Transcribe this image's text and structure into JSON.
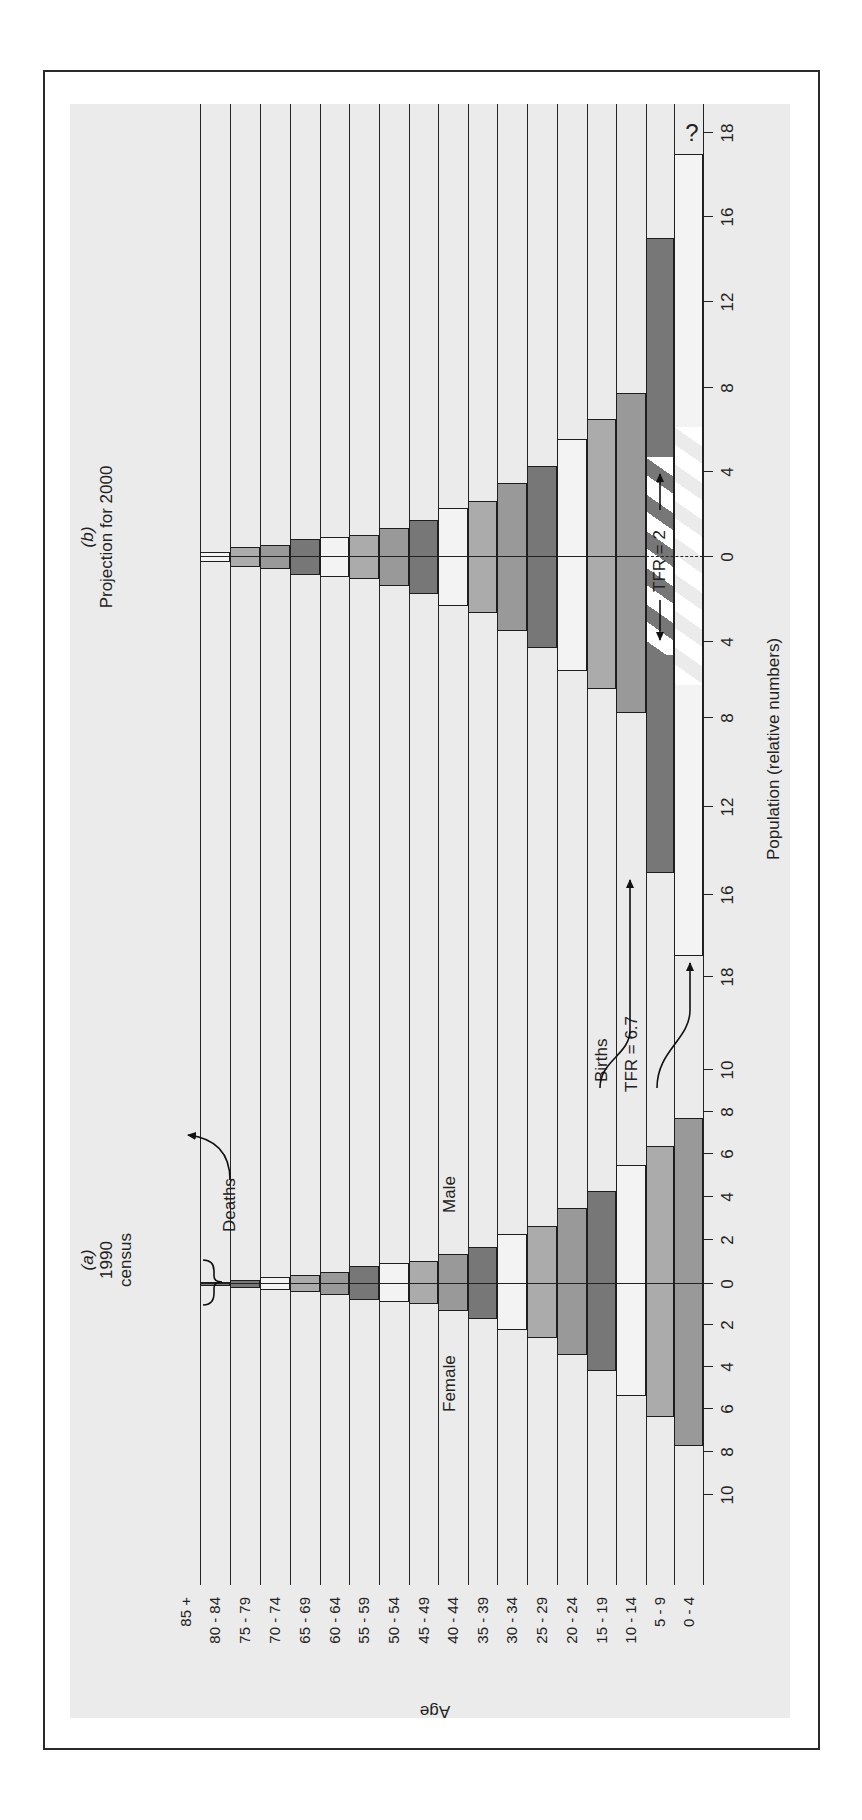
{
  "chart_data": {
    "type": "bar",
    "subtype": "population-pyramid",
    "orientation": "figure rotated 90 degrees counter-clockwise",
    "ylabel": "Age",
    "xlabel": "Population (relative numbers)",
    "age_groups": [
      "85 +",
      "80 - 84",
      "75 - 79",
      "70 - 74",
      "65 - 69",
      "60 - 64",
      "55 - 59",
      "50 - 54",
      "45 - 49",
      "40 - 44",
      "35 - 39",
      "30 - 34",
      "25 - 29",
      "20 - 24",
      "15 - 19",
      "10 - 14",
      "5 - 9",
      "0 - 4"
    ],
    "panels": [
      {
        "id": "a",
        "label": "(a)",
        "title_line1": "1990",
        "title_line2": "census",
        "female_label": "Female",
        "male_label": "Male",
        "center_px": 536,
        "ticks_female": [
          {
            "v": 0,
            "px": 536
          },
          {
            "v": 2,
            "px": 495
          },
          {
            "v": 4,
            "px": 453
          },
          {
            "v": 6,
            "px": 411
          },
          {
            "v": 8,
            "px": 368
          },
          {
            "v": 10,
            "px": 325
          }
        ],
        "ticks_male": [
          {
            "v": 0,
            "px": 536
          },
          {
            "v": 2,
            "px": 580
          },
          {
            "v": 4,
            "px": 623
          },
          {
            "v": 6,
            "px": 666
          },
          {
            "v": 8,
            "px": 708
          },
          {
            "v": 10,
            "px": 750
          }
        ],
        "series": [
          {
            "age": "80 - 84",
            "male": 0.1,
            "female": 0.1,
            "shade": "dark"
          },
          {
            "age": "75 - 79",
            "male": 0.2,
            "female": 0.2,
            "shade": "dark"
          },
          {
            "age": "70 - 74",
            "male": 0.3,
            "female": 0.3,
            "shade": "white"
          },
          {
            "age": "65 - 69",
            "male": 0.4,
            "female": 0.4,
            "shade": "light"
          },
          {
            "age": "60 - 64",
            "male": 0.55,
            "female": 0.55,
            "shade": "mid"
          },
          {
            "age": "55 - 59",
            "male": 0.8,
            "female": 0.8,
            "shade": "dark"
          },
          {
            "age": "50 - 54",
            "male": 0.95,
            "female": 0.9,
            "shade": "white"
          },
          {
            "age": "45 - 49",
            "male": 1.05,
            "female": 1.0,
            "shade": "light"
          },
          {
            "age": "40 - 44",
            "male": 1.35,
            "female": 1.3,
            "shade": "mid"
          },
          {
            "age": "35 - 39",
            "male": 1.7,
            "female": 1.7,
            "shade": "dark"
          },
          {
            "age": "30 - 34",
            "male": 2.3,
            "female": 2.25,
            "shade": "white"
          },
          {
            "age": "25 - 29",
            "male": 2.65,
            "female": 2.6,
            "shade": "light"
          },
          {
            "age": "20 - 24",
            "male": 3.5,
            "female": 3.45,
            "shade": "mid"
          },
          {
            "age": "15 - 19",
            "male": 4.3,
            "female": 4.2,
            "shade": "dark"
          },
          {
            "age": "10 - 14",
            "male": 5.5,
            "female": 5.4,
            "shade": "white"
          },
          {
            "age": "5 - 9",
            "male": 6.4,
            "female": 6.35,
            "shade": "light"
          },
          {
            "age": "0 - 4",
            "male": 7.7,
            "female": 7.7,
            "shade": "mid"
          }
        ]
      },
      {
        "id": "b",
        "label": "(b)",
        "title_line1": "Projection for 2000",
        "center_px": 1263,
        "ticks_female": [
          {
            "v": 0,
            "px": 1263
          },
          {
            "v": 4,
            "px": 1178
          },
          {
            "v": 8,
            "px": 1102
          },
          {
            "v": 12,
            "px": 1013
          },
          {
            "v": 16,
            "px": 925
          },
          {
            "v": 18,
            "px": 843
          }
        ],
        "ticks_male": [
          {
            "v": 0,
            "px": 1263
          },
          {
            "v": 4,
            "px": 1348
          },
          {
            "v": 8,
            "px": 1432
          },
          {
            "v": 12,
            "px": 1518
          },
          {
            "v": 16,
            "px": 1603
          },
          {
            "v": 18,
            "px": 1687
          }
        ],
        "series": [
          {
            "age": "80 - 84",
            "male": 0.25,
            "female": 0.25,
            "shade": "white"
          },
          {
            "age": "75 - 79",
            "male": 0.45,
            "female": 0.45,
            "shade": "light"
          },
          {
            "age": "70 - 74",
            "male": 0.55,
            "female": 0.55,
            "shade": "mid"
          },
          {
            "age": "65 - 69",
            "male": 0.85,
            "female": 0.85,
            "shade": "dark"
          },
          {
            "age": "60 - 64",
            "male": 0.95,
            "female": 0.95,
            "shade": "white"
          },
          {
            "age": "55 - 59",
            "male": 1.05,
            "female": 1.05,
            "shade": "light"
          },
          {
            "age": "50 - 54",
            "male": 1.35,
            "female": 1.35,
            "shade": "mid"
          },
          {
            "age": "45 - 49",
            "male": 1.75,
            "female": 1.75,
            "shade": "dark"
          },
          {
            "age": "40 - 44",
            "male": 2.3,
            "female": 2.3,
            "shade": "white"
          },
          {
            "age": "35 - 39",
            "male": 2.65,
            "female": 2.65,
            "shade": "light"
          },
          {
            "age": "30 - 34",
            "male": 3.5,
            "female": 3.5,
            "shade": "mid"
          },
          {
            "age": "25 - 29",
            "male": 4.3,
            "female": 4.3,
            "shade": "dark"
          },
          {
            "age": "20 - 24",
            "male": 5.55,
            "female": 5.55,
            "shade": "white"
          },
          {
            "age": "15 - 19",
            "male": 6.5,
            "female": 6.5,
            "shade": "light"
          },
          {
            "age": "10 - 14",
            "male": 7.75,
            "female": 7.75,
            "shade": "mid"
          },
          {
            "age": "5 - 9",
            "male": 15,
            "female": 15,
            "shade": "dark"
          },
          {
            "age": "0 - 4",
            "male": 17.5,
            "female": 17.5,
            "shade": "white"
          }
        ],
        "hatched_region": {
          "age": "5 - 9",
          "from": -4.8,
          "to": 4.8
        }
      }
    ],
    "x_tick_labels": [
      "10",
      "8",
      "6",
      "4",
      "2",
      "0",
      "2",
      "4",
      "6",
      "8",
      "10",
      "18",
      "16",
      "12",
      "8",
      "4",
      "0",
      "4",
      "8",
      "12",
      "16",
      "18"
    ],
    "annotations": {
      "deaths": "Deaths",
      "births": "Births",
      "tfr_1990": "TFR = 6.7",
      "tfr_2000": "TFR = 2",
      "unknown_marker": "?"
    },
    "colors": {
      "dark": "#777777",
      "mid": "#999999",
      "light": "#ababab",
      "white": "#f3f3f3",
      "panel_background": "#ebebeb"
    }
  }
}
